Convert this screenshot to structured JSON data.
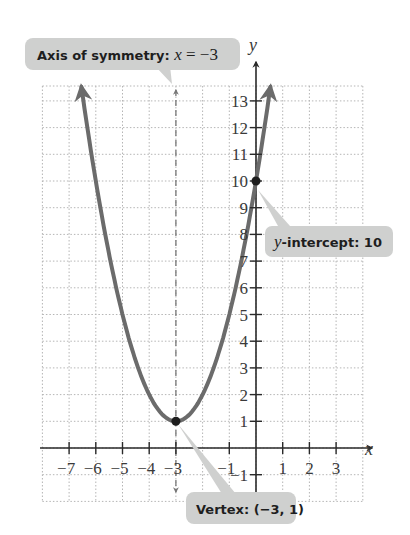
{
  "chart_data": {
    "type": "line",
    "title": "",
    "function": "y = (x + 3)^2 + 1",
    "xlabel": "x",
    "ylabel": "y",
    "xlim": [
      -8,
      4
    ],
    "ylim": [
      -2,
      13.5
    ],
    "grid": true,
    "x_ticks": [
      -7,
      -6,
      -5,
      -4,
      -3,
      -1,
      1,
      2,
      3
    ],
    "y_ticks": [
      -1,
      1,
      2,
      3,
      4,
      5,
      6,
      7,
      8,
      9,
      10,
      11,
      12,
      13
    ],
    "series": [
      {
        "name": "parabola",
        "x": [
          -6.54,
          -6,
          -5,
          -4,
          -3,
          -2,
          -1,
          0,
          0.54
        ],
        "y": [
          13.5,
          10,
          5,
          2,
          1,
          2,
          5,
          10,
          13.5
        ]
      }
    ],
    "points": [
      {
        "name": "vertex",
        "x": -3,
        "y": 1
      },
      {
        "name": "y-intercept",
        "x": 0,
        "y": 10
      }
    ],
    "axis_of_symmetry": {
      "x": -3,
      "style": "dashed"
    },
    "annotations": [
      {
        "text": "Axis of symmetry: x = −3",
        "target": "axis_of_symmetry"
      },
      {
        "text": "y-intercept: 10",
        "target": "y-intercept"
      },
      {
        "text": "Vertex: (−3, 1)",
        "target": "vertex"
      }
    ]
  },
  "labels": {
    "x_axis": "x",
    "y_axis": "y",
    "axis_callout_prefix": "Axis of symmetry: ",
    "axis_callout_var": "x",
    "axis_callout_suffix": " = −3",
    "yint_callout_var": "y",
    "yint_callout_suffix": "-intercept: 10",
    "vertex_callout": "Vertex: (−3, 1)"
  },
  "colors": {
    "curve": "#6b6b6b",
    "axis": "#2a2a2a",
    "grid": "#b5b5b5",
    "callout": "#cfd0cf",
    "point": "#1e1e1e"
  }
}
